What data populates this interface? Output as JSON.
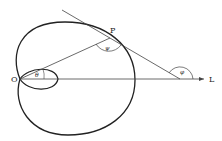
{
  "diagram": {
    "labels": {
      "origin": "O",
      "point": "P",
      "axis": "L",
      "theta": "θ",
      "psi": "ψ",
      "phi": "φ"
    },
    "colors": {
      "stroke": "#222222",
      "background": "#ffffff"
    }
  }
}
